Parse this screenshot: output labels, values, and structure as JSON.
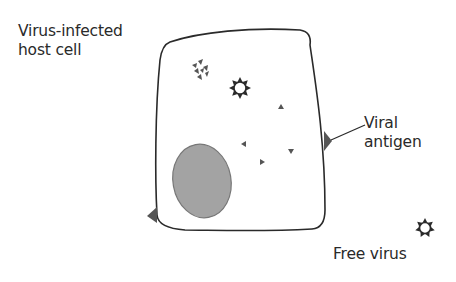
{
  "labels": {
    "host_cell_line1": "Virus-infected",
    "host_cell_line2": "host cell",
    "antigen_line1": "Viral",
    "antigen_line2": "antigen",
    "free_virus": "Free virus"
  },
  "colors": {
    "outline": "#2a2a2a",
    "nucleus_fill": "#a3a3a3",
    "nucleus_stroke": "#777777",
    "particle": "#555555",
    "antigen": "#555555",
    "background": "#ffffff"
  }
}
